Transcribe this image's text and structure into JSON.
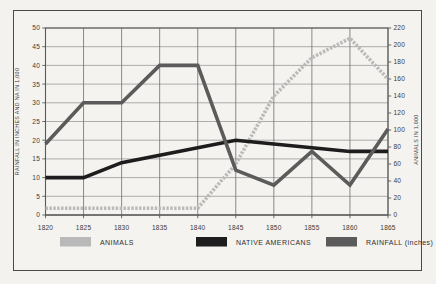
{
  "chart_data": {
    "type": "line",
    "title": "",
    "xlabel": "",
    "ylabel": "RAINFALL IN INCHES AND NA IN 1,000",
    "y2label": "ANIMALS IN 1,000",
    "x": [
      1820,
      1825,
      1830,
      1835,
      1840,
      1845,
      1850,
      1855,
      1860,
      1865
    ],
    "xtick_labels": [
      "1820",
      "1825",
      "1830",
      "1835",
      "1840",
      "1845",
      "1850",
      "1855",
      "1860",
      "1865"
    ],
    "ylim": [
      0,
      50
    ],
    "ytick_labels": [
      "0",
      "5",
      "10",
      "15",
      "20",
      "25",
      "30",
      "35",
      "40",
      "45",
      "50"
    ],
    "ytick_values": [
      0,
      5,
      10,
      15,
      20,
      25,
      30,
      35,
      40,
      45,
      50
    ],
    "y2lim": [
      0,
      220
    ],
    "y2tick_labels": [
      "0",
      "20",
      "40",
      "60",
      "80",
      "100",
      "120",
      "140",
      "160",
      "180",
      "200",
      "220"
    ],
    "y2tick_values": [
      0,
      20,
      40,
      60,
      80,
      100,
      120,
      140,
      160,
      180,
      200,
      220
    ],
    "grid": true,
    "legend_position": "bottom",
    "series": [
      {
        "name": "ANIMALS",
        "axis": "right",
        "color": "#b9b9b9",
        "values": [
          8,
          8,
          8,
          8,
          8,
          60,
          140,
          185,
          208,
          160
        ]
      },
      {
        "name": "NATIVE AMERICANS",
        "axis": "left",
        "color": "#1d1d1d",
        "values": [
          10,
          10,
          14,
          16,
          18,
          20,
          19,
          18,
          17,
          17
        ]
      },
      {
        "name": "RAINFALL (inches)",
        "axis": "left",
        "color": "#5b5b5b",
        "values": [
          19,
          30,
          30,
          40,
          40,
          12,
          8,
          17,
          8,
          23
        ]
      }
    ]
  },
  "legend": {
    "items": [
      {
        "label": "ANIMALS",
        "color": "#b9b9b9"
      },
      {
        "label": "NATIVE AMERICANS",
        "color": "#1d1d1d"
      },
      {
        "label": "RAINFALL (inches)",
        "color": "#5b5b5b"
      }
    ]
  },
  "axes": {
    "left_title": "RAINFALL IN INCHES AND NA IN 1,000",
    "right_title": "ANIMALS IN 1,000"
  }
}
